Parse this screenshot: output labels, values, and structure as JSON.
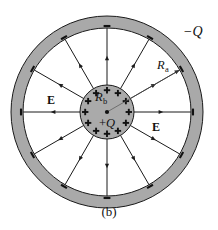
{
  "figure": {
    "caption": "(b)",
    "type": "electrostatics-field-diagram"
  },
  "labels": {
    "outer_charge": "−Q",
    "inner_charge": "+Q",
    "inner_radius": "R",
    "inner_radius_sub": "b",
    "outer_radius": "R",
    "outer_radius_sub": "a",
    "field_left": "E",
    "field_right": "E"
  },
  "signs": {
    "plus": "+",
    "minus": "−",
    "plus_count": 12,
    "minus_count": 12
  },
  "colors": {
    "shell_fill": "#a9a9a9",
    "inner_fill": "#aaaaaa",
    "stroke": "#1a1a1a",
    "background": "#ffffff",
    "gap_fill": "#ffffff"
  },
  "geometry": {
    "center_x": 107,
    "center_y": 112,
    "outer_shell_outer_radius": 96,
    "outer_shell_inner_radius": 84,
    "inner_sphere_radius": 27,
    "field_line_count": 12,
    "field_line_angle_step_deg": 30
  },
  "chart_data": {
    "type": "diagram",
    "title": "(b)",
    "elements": [
      {
        "name": "inner-sphere",
        "charge": "+Q",
        "radius_label": "Rb"
      },
      {
        "name": "outer-shell",
        "charge": "-Q",
        "radius_label": "Ra"
      },
      {
        "name": "field-lines",
        "symbol": "E",
        "count": 12,
        "direction": "radially outward"
      }
    ]
  }
}
